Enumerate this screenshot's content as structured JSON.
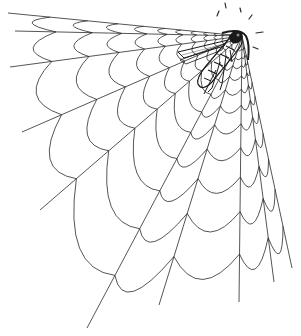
{
  "illustration": {
    "subject": "Fly caught in a corner spider web",
    "top_caption_clipped": "",
    "colors": {
      "background": "#ffffff",
      "ink": "#2a2a2a",
      "fly_dark": "#1a1a1a"
    },
    "web": {
      "corner": [
        242,
        36
      ],
      "radials": [
        [
          8,
          13
        ],
        [
          15,
          31
        ],
        [
          10,
          67
        ],
        [
          22,
          132
        ],
        [
          40,
          210
        ],
        [
          87,
          328
        ],
        [
          159,
          305
        ],
        [
          239,
          302
        ],
        [
          274,
          282
        ],
        [
          292,
          268
        ]
      ],
      "rings": [
        0.05,
        0.08,
        0.11,
        0.15,
        0.2,
        0.26,
        0.33,
        0.42,
        0.53,
        0.66,
        0.82
      ],
      "sag": 0.22
    },
    "fly": {
      "head": [
        234,
        38
      ],
      "tail": [
        198,
        84
      ]
    },
    "motion_lines": [
      [
        [
          217,
          16
        ],
        [
          219,
          11
        ]
      ],
      [
        [
          225,
          3
        ],
        [
          226,
          8
        ]
      ],
      [
        [
          240,
          8
        ],
        [
          241,
          12
        ]
      ],
      [
        [
          252,
          15
        ],
        [
          249,
          19
        ]
      ],
      [
        [
          256,
          33
        ],
        [
          263,
          32
        ]
      ],
      [
        [
          253,
          47
        ],
        [
          258,
          49
        ]
      ]
    ]
  }
}
